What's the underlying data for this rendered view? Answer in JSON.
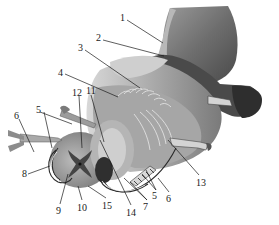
{
  "figure": {
    "labels": [
      {
        "id": "1",
        "text": "1",
        "x": 122,
        "y": 15
      },
      {
        "id": "2",
        "text": "2",
        "x": 97,
        "y": 35
      },
      {
        "id": "3",
        "text": "3",
        "x": 79,
        "y": 45
      },
      {
        "id": "4",
        "text": "4",
        "x": 59,
        "y": 70
      },
      {
        "id": "12",
        "text": "12",
        "x": 73,
        "y": 90
      },
      {
        "id": "11",
        "text": "11",
        "x": 87,
        "y": 88
      },
      {
        "id": "5a",
        "text": "5",
        "x": 37,
        "y": 107
      },
      {
        "id": "6a",
        "text": "6",
        "x": 15,
        "y": 113
      },
      {
        "id": "8",
        "text": "8",
        "x": 23,
        "y": 171
      },
      {
        "id": "9",
        "text": "9",
        "x": 57,
        "y": 208
      },
      {
        "id": "10",
        "text": "10",
        "x": 78,
        "y": 205
      },
      {
        "id": "15",
        "text": "15",
        "x": 103,
        "y": 203
      },
      {
        "id": "14",
        "text": "14",
        "x": 127,
        "y": 210
      },
      {
        "id": "7",
        "text": "7",
        "x": 144,
        "y": 204
      },
      {
        "id": "5b",
        "text": "5",
        "x": 153,
        "y": 193
      },
      {
        "id": "6b",
        "text": "6",
        "x": 167,
        "y": 196
      },
      {
        "id": "13",
        "text": "13",
        "x": 197,
        "y": 180
      }
    ],
    "colors": {
      "background": "#ffffff",
      "ink": "#1a1a1a",
      "dark_tissue": "#3a3a3a",
      "mid_tissue": "#8c8c8c",
      "light_tissue": "#c9c9c9",
      "pale_tissue": "#e2e2e2"
    }
  }
}
